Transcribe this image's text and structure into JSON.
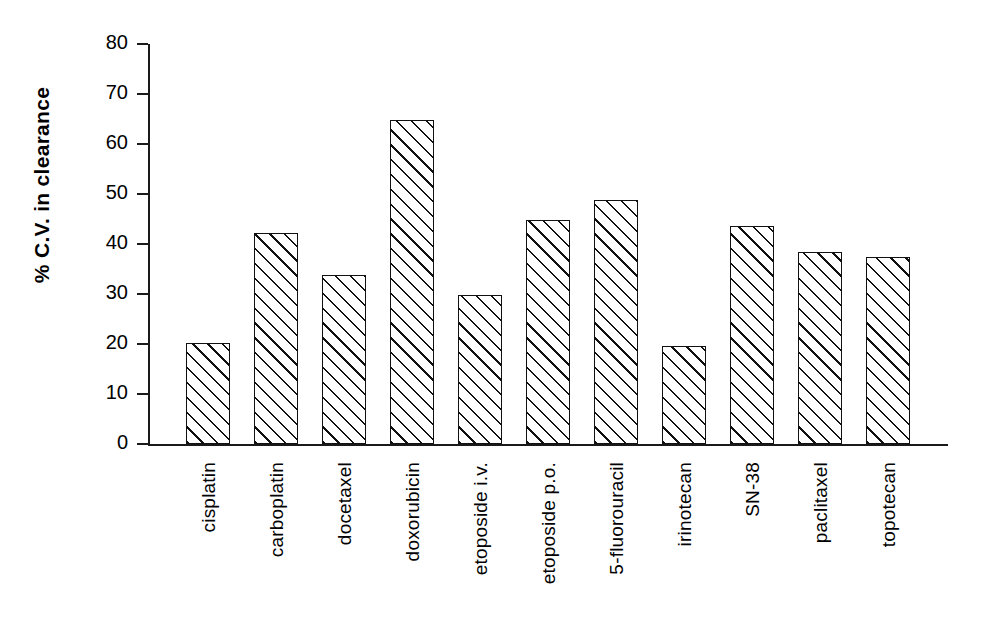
{
  "chart_data": {
    "type": "bar",
    "title": "",
    "subtitle": "",
    "xlabel": "",
    "ylabel": "% C.V. in clearance",
    "ylim": [
      0,
      80
    ],
    "yticks": [
      0,
      10,
      20,
      30,
      40,
      50,
      60,
      70,
      80
    ],
    "ytick_labels": [
      "0",
      "10",
      "20",
      "30",
      "40",
      "50",
      "60",
      "70",
      "80"
    ],
    "grid": false,
    "legend": null,
    "bar_style": {
      "fill": "#ffffff",
      "edge": "#111111",
      "hatch": "diagonal-45"
    },
    "categories": [
      "cisplatin",
      "carboplatin",
      "docetaxel",
      "doxorubicin",
      "etoposide i.v.",
      "etoposide p.o.",
      "5-fluorouracil",
      "irinotecan",
      "SN-38",
      "paclitaxel",
      "topotecan"
    ],
    "values": [
      20.2,
      42.2,
      33.8,
      64.8,
      29.8,
      44.8,
      48.8,
      19.6,
      43.6,
      38.4,
      37.4
    ]
  },
  "axes": {
    "y_axis_label": "% C.V. in clearance"
  }
}
